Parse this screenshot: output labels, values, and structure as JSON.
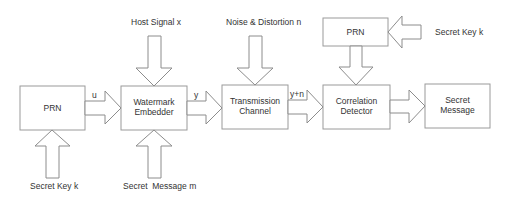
{
  "diagram": {
    "blocks": {
      "prn_left": {
        "line1": "PRN",
        "line2": ""
      },
      "embedder": {
        "line1": "Watermark",
        "line2": "Embedder"
      },
      "channel": {
        "line1": "Transmission",
        "line2": "Channel"
      },
      "detector": {
        "line1": "Correlation",
        "line2": "Detector"
      },
      "message": {
        "line1": "Secret",
        "line2": "Message"
      },
      "prn_top": {
        "line1": "PRN",
        "line2": ""
      }
    },
    "inputs": {
      "host_signal": "Host Signal x",
      "noise": "Noise & Distortion n",
      "secret_key_bottom": "Secret Key k",
      "secret_message": "Secret  Message m",
      "secret_key_top": "Secret Key k"
    },
    "edges": {
      "u": "u",
      "y": "y",
      "y_plus_n": "y+n"
    },
    "colors": {
      "stroke": "#9a9a9a",
      "text": "#333333",
      "background": "#ffffff"
    }
  }
}
